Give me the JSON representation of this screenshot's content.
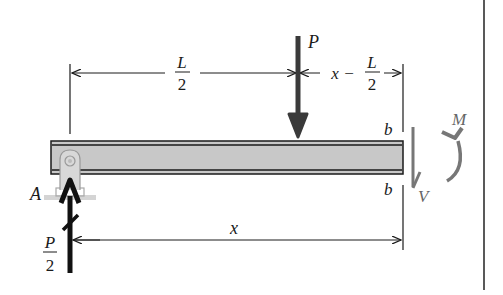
{
  "diagram": {
    "type": "free-body diagram of simply supported beam segment",
    "labels": {
      "load": "P",
      "support": "A",
      "reaction_num": "P",
      "reaction_den": "2",
      "half_length_num": "L",
      "half_length_den": "2",
      "offset_prefix": "x −",
      "offset_num": "L",
      "offset_den": "2",
      "distance": "x",
      "section_top": "b",
      "section_bottom": "b",
      "moment": "M",
      "shear": "V"
    },
    "colors": {
      "beam_fill": "#c8c8c8",
      "beam_edge": "#1a1a1a",
      "load_arrow": "#3a3a3a",
      "reaction_arrow": "#111111",
      "internal_force": "#777777",
      "support": "#b0b0b0"
    }
  }
}
